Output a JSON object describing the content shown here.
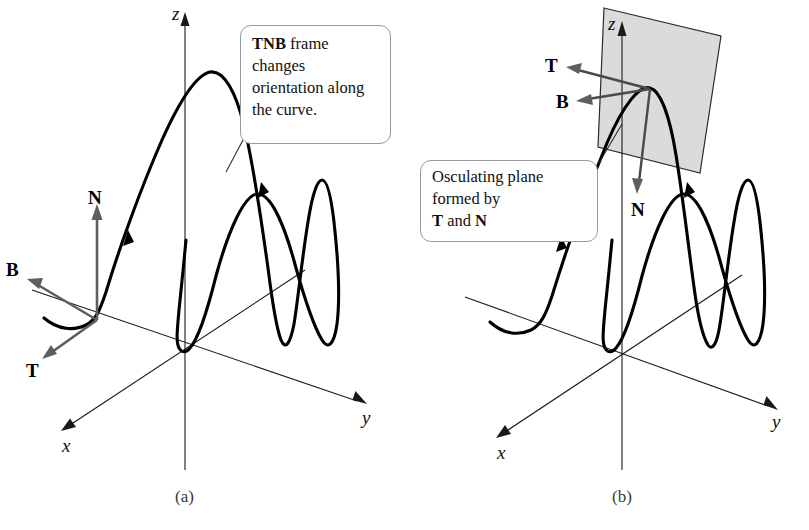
{
  "figure": {
    "background_color": "#ffffff",
    "curve_color": "#000000",
    "vector_color": "#5e5e5e",
    "plane_fill_color": "#d9d9d9",
    "plane_stroke_color": "#2b2b2b",
    "axis_color": "#1a1a1a"
  },
  "panel_a": {
    "caption": "(a)",
    "callout": {
      "bold_lead": "TNB",
      "text_rest": " frame changes orientation along the curve.",
      "full_text": "TNB frame changes orientation along the curve."
    },
    "axes": [
      {
        "name": "z",
        "label": "z"
      },
      {
        "name": "y",
        "label": "y"
      },
      {
        "name": "x",
        "label": "x"
      }
    ],
    "vectors": [
      {
        "name": "N",
        "label": "N",
        "direction": "up"
      },
      {
        "name": "B",
        "label": "B",
        "direction": "up-left"
      },
      {
        "name": "T",
        "label": "T",
        "direction": "down-left"
      }
    ]
  },
  "panel_b": {
    "caption": "(b)",
    "callout": {
      "line1": "Osculating plane",
      "line2": "formed by",
      "line3_bold_a": "T",
      "line3_mid": " and ",
      "line3_bold_b": "N",
      "full_text": "Osculating plane formed by T and N"
    },
    "axes": [
      {
        "name": "z",
        "label": "z"
      },
      {
        "name": "y",
        "label": "y"
      },
      {
        "name": "x",
        "label": "x"
      }
    ],
    "vectors": [
      {
        "name": "T",
        "label": "T",
        "direction": "left-up"
      },
      {
        "name": "B",
        "label": "B",
        "direction": "left"
      },
      {
        "name": "N",
        "label": "N",
        "direction": "down"
      }
    ],
    "plane": {
      "name": "osculating-plane",
      "shading": "light gray"
    }
  }
}
